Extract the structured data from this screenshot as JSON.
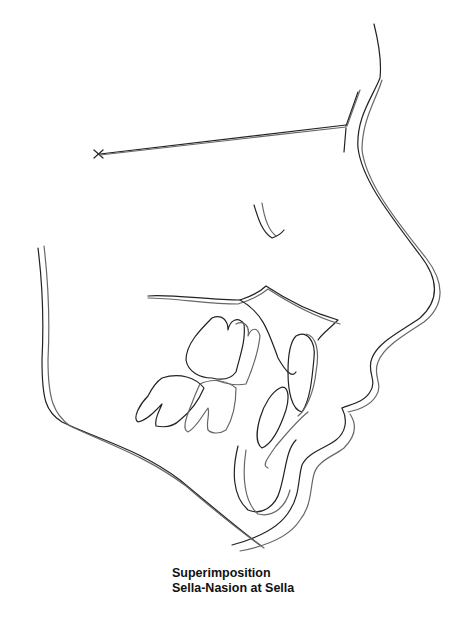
{
  "figure": {
    "type": "cephalometric superimposition tracing",
    "caption_line1": "Superimposition",
    "caption_line2": "Sella-Nasion at Sella",
    "landmarks": [
      "sella-marker-x",
      "nasion",
      "sella-nasion-line"
    ],
    "tracings": [
      "soft-tissue-profile",
      "mandible-border",
      "maxilla-palate",
      "molars",
      "incisors",
      "symphysis",
      "orbit"
    ],
    "colors": {
      "tracing_1": "#222222",
      "tracing_2": "#666666",
      "background": "#ffffff"
    }
  }
}
